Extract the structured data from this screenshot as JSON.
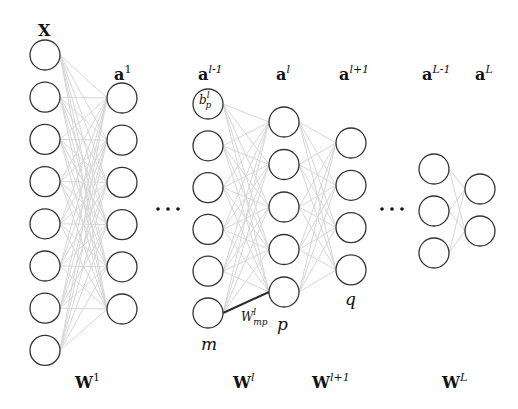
{
  "diagram": {
    "layers": [
      {
        "id": "X",
        "label_base": "X",
        "label_sup": "",
        "nodes": 8
      },
      {
        "id": "a1",
        "label_base": "a",
        "label_sup": "1",
        "nodes": 6
      },
      {
        "id": "al-1",
        "label_base": "a",
        "label_sup": "l-1",
        "nodes": 6,
        "first_node_label": {
          "base": "b",
          "sup": "l",
          "sub": "p"
        }
      },
      {
        "id": "al",
        "label_base": "a",
        "label_sup": "l",
        "nodes": 5
      },
      {
        "id": "al+1",
        "label_base": "a",
        "label_sup": "l+1",
        "nodes": 4
      },
      {
        "id": "aL-1",
        "label_base": "a",
        "label_sup": "L-1",
        "nodes": 3
      },
      {
        "id": "aL",
        "label_base": "a",
        "label_sup": "L",
        "nodes": 2
      }
    ],
    "ellipsis": "…",
    "weights": [
      {
        "base": "W",
        "sup": "1"
      },
      {
        "base": "W",
        "sup": "l"
      },
      {
        "base": "W",
        "sup": "l+1"
      },
      {
        "base": "W",
        "sup": "L"
      }
    ],
    "node_labels": {
      "m": "m",
      "p": "p",
      "q": "q"
    },
    "highlighted_edge": {
      "base": "W",
      "sup": "l",
      "sub": "mp",
      "from": "m",
      "to": "p"
    },
    "colors": {
      "edge": "#d6d6d6",
      "highlight_edge": "#2b2b2b",
      "node_stroke": "#333333"
    }
  }
}
